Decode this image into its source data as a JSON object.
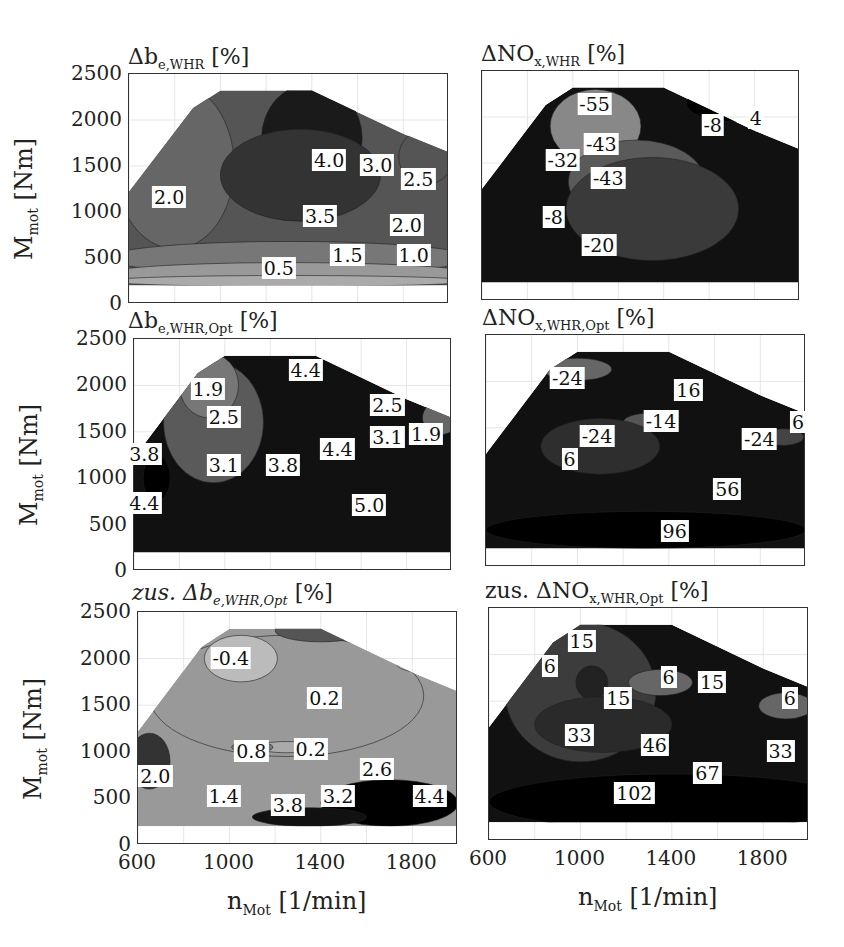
{
  "chart_data": [
    {
      "type": "heatmap",
      "subtype": "filled-contour",
      "title": "Δb_e,WHR [%]",
      "xlabel": "n_Mot [1/min]",
      "ylabel": "M_mot [Nm]",
      "xlim": [
        600,
        2000
      ],
      "ylim": [
        0,
        2500
      ],
      "xticks": [
        600,
        1000,
        1400,
        1800
      ],
      "yticks": [
        0,
        500,
        1000,
        1500,
        2000,
        2500
      ],
      "contour_labels": [
        {
          "value": "2.0",
          "x": 780,
          "y": 1150
        },
        {
          "value": "4.0",
          "x": 1480,
          "y": 1550
        },
        {
          "value": "3.0",
          "x": 1690,
          "y": 1500
        },
        {
          "value": "2.5",
          "x": 1870,
          "y": 1350
        },
        {
          "value": "3.5",
          "x": 1440,
          "y": 950
        },
        {
          "value": "2.0",
          "x": 1820,
          "y": 850
        },
        {
          "value": "1.5",
          "x": 1560,
          "y": 520
        },
        {
          "value": "1.0",
          "x": 1850,
          "y": 520
        },
        {
          "value": "0.5",
          "x": 1260,
          "y": 380
        }
      ],
      "grid": true
    },
    {
      "type": "heatmap",
      "subtype": "filled-contour",
      "title": "ΔNO_x,WHR [%]",
      "xlabel": "n_Mot [1/min]",
      "ylabel": "M_mot [Nm]",
      "xlim": [
        600,
        2000
      ],
      "ylim": [
        0,
        2500
      ],
      "contour_labels": [
        {
          "value": "-55",
          "x": 1100,
          "y": 2130
        },
        {
          "value": "-43",
          "x": 1130,
          "y": 1700
        },
        {
          "value": "-32",
          "x": 960,
          "y": 1520
        },
        {
          "value": "-43",
          "x": 1160,
          "y": 1330
        },
        {
          "value": "-8",
          "x": 1620,
          "y": 1900
        },
        {
          "value": "4",
          "x": 1810,
          "y": 1980
        },
        {
          "value": "-8",
          "x": 920,
          "y": 900
        },
        {
          "value": "-20",
          "x": 1120,
          "y": 600
        }
      ],
      "grid": true
    },
    {
      "type": "heatmap",
      "subtype": "filled-contour",
      "title": "Δb_e,WHR,Opt [%]",
      "xlabel": "n_Mot [1/min]",
      "ylabel": "M_mot [Nm]",
      "xlim": [
        600,
        2000
      ],
      "ylim": [
        0,
        2500
      ],
      "contour_labels": [
        {
          "value": "1.9",
          "x": 930,
          "y": 1950
        },
        {
          "value": "2.5",
          "x": 1000,
          "y": 1650
        },
        {
          "value": "4.4",
          "x": 1360,
          "y": 2150
        },
        {
          "value": "2.5",
          "x": 1720,
          "y": 1780
        },
        {
          "value": "3.1",
          "x": 1720,
          "y": 1430
        },
        {
          "value": "1.9",
          "x": 1890,
          "y": 1470
        },
        {
          "value": "3.8",
          "x": 650,
          "y": 1250
        },
        {
          "value": "3.1",
          "x": 1000,
          "y": 1130
        },
        {
          "value": "3.8",
          "x": 1260,
          "y": 1130
        },
        {
          "value": "4.4",
          "x": 1500,
          "y": 1300
        },
        {
          "value": "5.0",
          "x": 1640,
          "y": 700
        },
        {
          "value": "4.4",
          "x": 650,
          "y": 720
        }
      ],
      "grid": true
    },
    {
      "type": "heatmap",
      "subtype": "filled-contour",
      "title": "ΔNO_x,WHR,Opt [%]",
      "xlabel": "n_Mot [1/min]",
      "ylabel": "M_mot [Nm]",
      "xlim": [
        600,
        2000
      ],
      "ylim": [
        0,
        2500
      ],
      "contour_labels": [
        {
          "value": "-24",
          "x": 960,
          "y": 2030
        },
        {
          "value": "16",
          "x": 1490,
          "y": 1900
        },
        {
          "value": "-14",
          "x": 1370,
          "y": 1560
        },
        {
          "value": "-24",
          "x": 1090,
          "y": 1400
        },
        {
          "value": "6",
          "x": 970,
          "y": 1150
        },
        {
          "value": "6",
          "x": 1970,
          "y": 1550
        },
        {
          "value": "-24",
          "x": 1800,
          "y": 1370
        },
        {
          "value": "56",
          "x": 1660,
          "y": 830
        },
        {
          "value": "96",
          "x": 1430,
          "y": 380
        }
      ],
      "grid": true
    },
    {
      "type": "heatmap",
      "subtype": "filled-contour",
      "title": "zus. Δb_e,WHR,Opt [%]",
      "xlabel": "n_Mot [1/min]",
      "ylabel": "M_mot [Nm]",
      "xlim": [
        600,
        2000
      ],
      "ylim": [
        0,
        2500
      ],
      "contour_labels": [
        {
          "value": "-0.4",
          "x": 1010,
          "y": 2000
        },
        {
          "value": "0.2",
          "x": 1420,
          "y": 1570
        },
        {
          "value": "0.8",
          "x": 1100,
          "y": 1000
        },
        {
          "value": "0.2",
          "x": 1360,
          "y": 1020
        },
        {
          "value": "2.6",
          "x": 1650,
          "y": 800
        },
        {
          "value": "2.0",
          "x": 680,
          "y": 730
        },
        {
          "value": "1.4",
          "x": 980,
          "y": 520
        },
        {
          "value": "3.8",
          "x": 1260,
          "y": 420
        },
        {
          "value": "3.2",
          "x": 1480,
          "y": 520
        },
        {
          "value": "4.4",
          "x": 1880,
          "y": 520
        }
      ],
      "grid": true
    },
    {
      "type": "heatmap",
      "subtype": "filled-contour",
      "title": "zus. ΔNO_x,WHR,Opt [%]",
      "xlabel": "n_Mot [1/min]",
      "ylabel": "M_mot [Nm]",
      "xlim": [
        600,
        2000
      ],
      "ylim": [
        0,
        2500
      ],
      "contour_labels": [
        {
          "value": "15",
          "x": 1010,
          "y": 2130
        },
        {
          "value": "6",
          "x": 870,
          "y": 1870
        },
        {
          "value": "15",
          "x": 1170,
          "y": 1520
        },
        {
          "value": "6",
          "x": 1390,
          "y": 1750
        },
        {
          "value": "15",
          "x": 1580,
          "y": 1700
        },
        {
          "value": "6",
          "x": 1920,
          "y": 1520
        },
        {
          "value": "33",
          "x": 1000,
          "y": 1130
        },
        {
          "value": "46",
          "x": 1330,
          "y": 1020
        },
        {
          "value": "33",
          "x": 1880,
          "y": 950
        },
        {
          "value": "67",
          "x": 1560,
          "y": 720
        },
        {
          "value": "102",
          "x": 1240,
          "y": 500
        }
      ],
      "grid": true
    }
  ],
  "panels": [
    {
      "title_main": "Δb",
      "title_sub": "e,WHR",
      "title_unit": " [%]"
    },
    {
      "title_main": "ΔNO",
      "title_sub": "x,WHR",
      "title_unit": " [%]"
    },
    {
      "title_main": "Δb",
      "title_sub": "e,WHR,Opt",
      "title_unit": " [%]"
    },
    {
      "title_main": "ΔNO",
      "title_sub": "x,WHR,Opt",
      "title_unit": " [%]"
    },
    {
      "title_main": "zus. Δb",
      "title_sub": "e,WHR,Opt",
      "title_unit": " [%]"
    },
    {
      "title_main": "zus. ΔNO",
      "title_sub": "x,WHR,Opt",
      "title_unit": " [%]"
    }
  ],
  "axes": {
    "ylabel_main": "M",
    "ylabel_sub": "mot",
    "ylabel_unit": " [Nm]",
    "xlabel_main": "n",
    "xlabel_sub": "Mot",
    "xlabel_unit": " [1/min]",
    "yticks": [
      "2500",
      "2000",
      "1500",
      "1000",
      "500",
      "0"
    ],
    "xticks": [
      "600",
      "1000",
      "1400",
      "1800"
    ]
  }
}
